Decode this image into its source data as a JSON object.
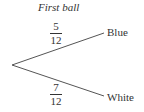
{
  "diagram": {
    "type": "probability-tree",
    "title": "First ball",
    "origin": {
      "x": 12,
      "y": 65
    },
    "branches": [
      {
        "outcome": "Blue",
        "numerator": "5",
        "denominator": "12",
        "end": {
          "x": 104,
          "y": 33
        }
      },
      {
        "outcome": "White",
        "numerator": "7",
        "denominator": "12",
        "end": {
          "x": 104,
          "y": 96
        }
      }
    ],
    "line_color": "#555555",
    "text_color": "#333333"
  }
}
